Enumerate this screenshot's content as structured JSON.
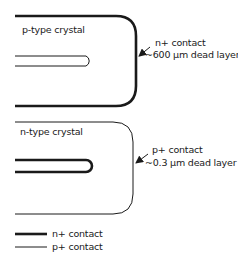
{
  "diagram": {
    "top_crystal": {
      "label": "p-type crystal",
      "contact_label": "n+ contact",
      "dead_layer_label": "~600 µm dead layer"
    },
    "bottom_crystal": {
      "label": "n-type crystal",
      "contact_label": "p+ contact",
      "dead_layer_label": "~0.3 µm dead layer"
    },
    "legend": [
      {
        "style": "thick",
        "label": "n+ contact"
      },
      {
        "style": "thin",
        "label": "p+ contact"
      }
    ],
    "colors": {
      "line": "#1a1a1a",
      "background": "#ffffff"
    }
  }
}
